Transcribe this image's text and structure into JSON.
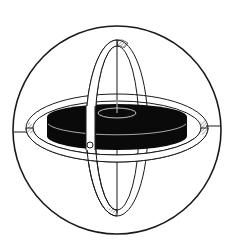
{
  "diagram": {
    "colors": {
      "background": "#ffffff",
      "stroke": "#1a1a1a",
      "rotor": "#0a0a0a",
      "ring_fill": "#ffffff"
    },
    "parts": [
      {
        "id": "outer-sphere",
        "label": "outer frame circle"
      },
      {
        "id": "horizontal-gimbal",
        "label": "horizontal gimbal ring"
      },
      {
        "id": "vertical-gimbal",
        "label": "vertical gimbal ring"
      },
      {
        "id": "rotor",
        "label": "rotor disc"
      },
      {
        "id": "spin-axis",
        "label": "spin axis"
      },
      {
        "id": "pivot",
        "label": "pivot bearing"
      }
    ]
  }
}
